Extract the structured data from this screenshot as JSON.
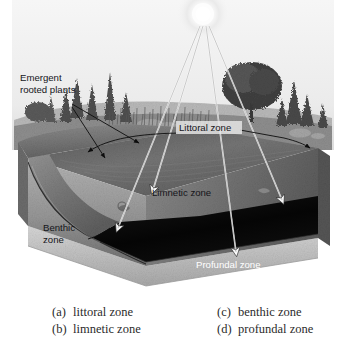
{
  "figure": {
    "sun": {
      "name": "sun"
    },
    "callouts": {
      "emergent_plants": "Emergent\nrooted plants",
      "emergent_plants_line1": "Emergent",
      "emergent_plants_line2": "rooted plants",
      "littoral": "Littoral zone",
      "limnetic": "Limnetic zone",
      "benthic_line1": "Benthic",
      "benthic_line2": "zone",
      "profundal": "Profundal zone"
    },
    "colors": {
      "sky": "#f2f2f2",
      "water_surface": "#6d6d6d",
      "limnetic_face": "#9d9d9d",
      "profundal": "#070707",
      "sediment": "#6a6a6a",
      "bank": "#8f8f8f",
      "base": "#c9c9c9",
      "label_dark": "#15151a",
      "label_light": "#ffffff",
      "ray": "#ffffff",
      "leader": "#101010"
    }
  },
  "answers": {
    "left": [
      {
        "key": "(a)",
        "text": "littoral zone"
      },
      {
        "key": "(b)",
        "text": "limnetic zone"
      }
    ],
    "right": [
      {
        "key": "(c)",
        "text": "benthic zone"
      },
      {
        "key": "(d)",
        "text": "profundal zone"
      }
    ]
  }
}
